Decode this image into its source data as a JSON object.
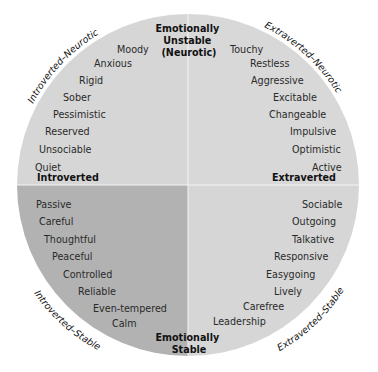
{
  "colors": {
    "quadrant_light": "#d6d6d6",
    "quadrant_dark": "#b2b2b2",
    "divider": "#f4f4f4",
    "text": "#2a2a2a"
  },
  "axes": {
    "top": [
      "Emotionally",
      "Unstable",
      "(Neurotic)"
    ],
    "bottom": [
      "Emotionally",
      "Stable"
    ],
    "left": "Introverted",
    "right": "Extraverted"
  },
  "quadrant_labels": {
    "top_left": "Introverted–Neurotic",
    "top_right": "Extraverted–Neurotic",
    "bottom_left": "Introverted–Stable",
    "bottom_right": "Extraverted–Stable"
  },
  "traits": {
    "top_left": [
      "Moody",
      "Anxious",
      "Rigid",
      "Sober",
      "Pessimistic",
      "Reserved",
      "Unsociable",
      "Quiet"
    ],
    "top_right": [
      "Touchy",
      "Restless",
      "Aggressive",
      "Excitable",
      "Changeable",
      "Impulsive",
      "Optimistic",
      "Active"
    ],
    "bottom_left": [
      "Passive",
      "Careful",
      "Thoughtful",
      "Peaceful",
      "Controlled",
      "Reliable",
      "Even-tempered",
      "Calm"
    ],
    "bottom_right": [
      "Sociable",
      "Outgoing",
      "Talkative",
      "Responsive",
      "Easygoing",
      "Lively",
      "Carefree",
      "Leadership"
    ]
  }
}
